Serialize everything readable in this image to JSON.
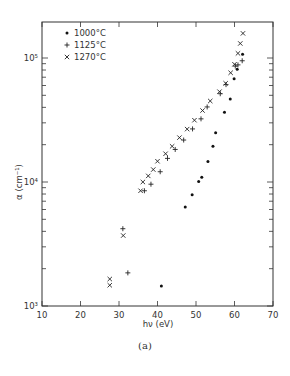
{
  "figure": {
    "caption": "(a)"
  },
  "chart_data": {
    "type": "scatter",
    "title": "",
    "xlabel": "hν (eV)",
    "ylabel": "α (cm⁻¹)",
    "xlim": [
      10,
      70
    ],
    "ylim": [
      1000,
      200000
    ],
    "yscale": "log",
    "grid": false,
    "x_ticks": [
      10,
      20,
      30,
      40,
      50,
      60,
      70
    ],
    "x_tick_labels": [
      "10",
      "20",
      "30",
      "40",
      "50",
      "60",
      "70"
    ],
    "y_ticks": [
      1000,
      10000,
      100000
    ],
    "y_tick_labels": [
      "10³",
      "10⁴",
      "10⁵"
    ],
    "legend_position": "upper-left",
    "series": [
      {
        "name": "1000°C",
        "marker": "dot",
        "points": [
          [
            41.0,
            1450
          ],
          [
            47.2,
            6300
          ],
          [
            49.0,
            7900
          ],
          [
            50.7,
            10100
          ],
          [
            51.5,
            10900
          ],
          [
            53.1,
            14600
          ],
          [
            54.4,
            19400
          ],
          [
            55.1,
            25000
          ],
          [
            57.4,
            36500
          ],
          [
            58.9,
            46700
          ],
          [
            60.7,
            81000
          ],
          [
            59.9,
            68000
          ],
          [
            62.1,
            107000
          ]
        ]
      },
      {
        "name": "1125°C",
        "marker": "plus",
        "points": [
          [
            31.0,
            4200
          ],
          [
            32.3,
            1850
          ],
          [
            36.6,
            8500
          ],
          [
            38.3,
            9600
          ],
          [
            40.7,
            12100
          ],
          [
            42.6,
            15500
          ],
          [
            44.6,
            18300
          ],
          [
            46.8,
            21800
          ],
          [
            49.1,
            26800
          ],
          [
            51.3,
            32300
          ],
          [
            52.9,
            40300
          ],
          [
            56.3,
            51500
          ],
          [
            57.8,
            61000
          ],
          [
            60.2,
            86000
          ],
          [
            60.9,
            88000
          ],
          [
            62.0,
            95000
          ]
        ]
      },
      {
        "name": "1270°C",
        "marker": "x",
        "points": [
          [
            27.6,
            1470
          ],
          [
            27.6,
            1650
          ],
          [
            31.1,
            3700
          ],
          [
            35.6,
            8500
          ],
          [
            36.2,
            10000
          ],
          [
            37.6,
            11200
          ],
          [
            38.9,
            12600
          ],
          [
            40.0,
            14700
          ],
          [
            42.1,
            16900
          ],
          [
            43.8,
            19400
          ],
          [
            45.7,
            22800
          ],
          [
            47.7,
            26700
          ],
          [
            49.6,
            31500
          ],
          [
            51.7,
            37700
          ],
          [
            53.7,
            45000
          ],
          [
            56.1,
            53500
          ],
          [
            57.7,
            62500
          ],
          [
            59.0,
            76000
          ],
          [
            60.0,
            89000
          ],
          [
            60.9,
            109000
          ],
          [
            61.5,
            131000
          ],
          [
            62.2,
            158000
          ]
        ]
      }
    ]
  }
}
